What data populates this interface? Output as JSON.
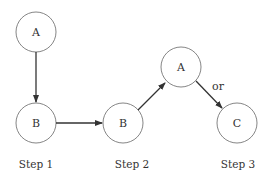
{
  "nodes": [
    {
      "id": "a1",
      "label": "A",
      "cx": 36,
      "cy": 32
    },
    {
      "id": "b1",
      "label": "B",
      "cx": 36,
      "cy": 123
    },
    {
      "id": "b2",
      "label": "B",
      "cx": 123,
      "cy": 123
    },
    {
      "id": "a2",
      "label": "A",
      "cx": 181,
      "cy": 67
    },
    {
      "id": "c",
      "label": "C",
      "cx": 237,
      "cy": 123
    }
  ],
  "edge_label": "or",
  "steps": [
    "Step 1",
    "Step 2",
    "Step 3"
  ]
}
